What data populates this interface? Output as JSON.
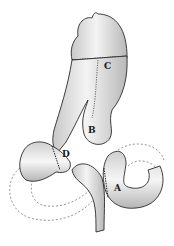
{
  "figure": {
    "type": "surgical anatomy illustration",
    "labels": [
      {
        "id": "A",
        "text": "A",
        "x": 114,
        "y": 184
      },
      {
        "id": "B",
        "text": "B",
        "x": 88,
        "y": 126
      },
      {
        "id": "C",
        "text": "C",
        "x": 104,
        "y": 62
      },
      {
        "id": "D",
        "text": "D",
        "x": 62,
        "y": 150
      }
    ],
    "colors": {
      "outline": "#2a2a2a",
      "shading": "#bdbdbd",
      "fill": "#f2f2f2",
      "dashed": "#7a7a7a"
    }
  }
}
